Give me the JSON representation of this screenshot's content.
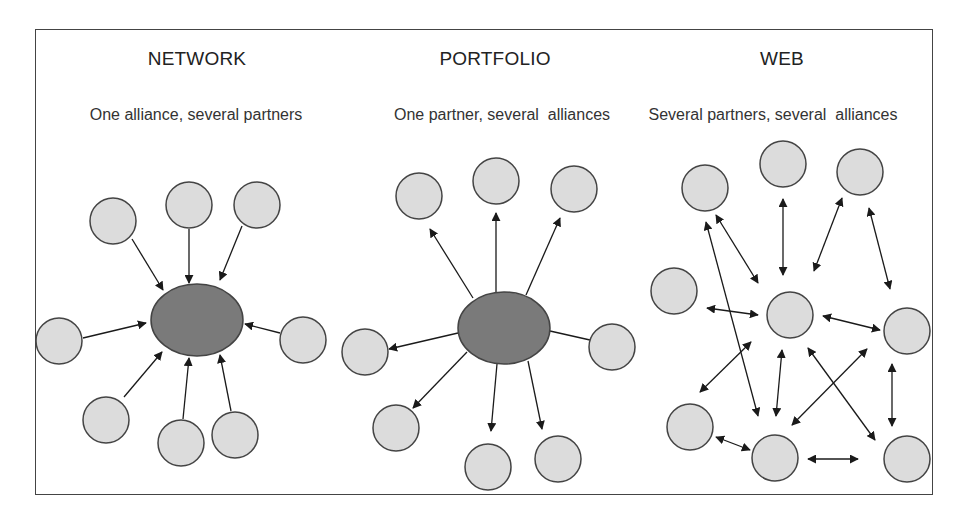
{
  "colors": {
    "partner_fill": "#dcdcdc",
    "hub_fill": "#7a7a7a",
    "stroke": "#444444",
    "arrow": "#1a1a1a"
  },
  "panels": [
    {
      "id": "network",
      "title": "NETWORK",
      "subtitle": "One alliance, several partners",
      "hub": {
        "cx": 197,
        "cy": 320,
        "rx": 46,
        "ry": 36
      },
      "nodes": [
        {
          "cx": 113,
          "cy": 221
        },
        {
          "cx": 189,
          "cy": 205
        },
        {
          "cx": 257,
          "cy": 205
        },
        {
          "cx": 59,
          "cy": 341
        },
        {
          "cx": 303,
          "cy": 340
        },
        {
          "cx": 106,
          "cy": 420
        },
        {
          "cx": 181,
          "cy": 443
        },
        {
          "cx": 235,
          "cy": 435
        }
      ],
      "edges": [
        {
          "x1": 132,
          "y1": 239,
          "x2": 163,
          "y2": 290,
          "head_end": true,
          "head_start": false
        },
        {
          "x1": 189,
          "y1": 229,
          "x2": 189,
          "y2": 283,
          "head_end": true,
          "head_start": false
        },
        {
          "x1": 242,
          "y1": 226,
          "x2": 220,
          "y2": 280,
          "head_end": true,
          "head_start": false
        },
        {
          "x1": 83,
          "y1": 338,
          "x2": 146,
          "y2": 323,
          "head_end": true,
          "head_start": false
        },
        {
          "x1": 280,
          "y1": 333,
          "x2": 245,
          "y2": 324,
          "head_end": true,
          "head_start": false
        },
        {
          "x1": 124,
          "y1": 397,
          "x2": 162,
          "y2": 352,
          "head_end": true,
          "head_start": false
        },
        {
          "x1": 183,
          "y1": 419,
          "x2": 189,
          "y2": 358,
          "head_end": true,
          "head_start": false
        },
        {
          "x1": 231,
          "y1": 411,
          "x2": 220,
          "y2": 355,
          "head_end": true,
          "head_start": false
        }
      ]
    },
    {
      "id": "portfolio",
      "title": "PORTFOLIO",
      "subtitle": "One partner, several  alliances",
      "hub": {
        "cx": 504,
        "cy": 328,
        "rx": 46,
        "ry": 36
      },
      "nodes": [
        {
          "cx": 419,
          "cy": 196
        },
        {
          "cx": 496,
          "cy": 181
        },
        {
          "cx": 574,
          "cy": 189
        },
        {
          "cx": 365,
          "cy": 352
        },
        {
          "cx": 612,
          "cy": 347
        },
        {
          "cx": 396,
          "cy": 428
        },
        {
          "cx": 488,
          "cy": 467
        },
        {
          "cx": 558,
          "cy": 459
        }
      ],
      "edges": [
        {
          "x1": 473,
          "y1": 298,
          "x2": 430,
          "y2": 229,
          "head_end": true,
          "head_start": false
        },
        {
          "x1": 496,
          "y1": 292,
          "x2": 496,
          "y2": 213,
          "head_end": true,
          "head_start": false
        },
        {
          "x1": 526,
          "y1": 295,
          "x2": 560,
          "y2": 218,
          "head_end": true,
          "head_start": false
        },
        {
          "x1": 458,
          "y1": 333,
          "x2": 389,
          "y2": 349,
          "head_end": true,
          "head_start": false
        },
        {
          "x1": 550,
          "y1": 331,
          "x2": 590,
          "y2": 340,
          "head_end": false,
          "head_start": false
        },
        {
          "x1": 467,
          "y1": 352,
          "x2": 413,
          "y2": 408,
          "head_end": true,
          "head_start": false
        },
        {
          "x1": 497,
          "y1": 364,
          "x2": 491,
          "y2": 431,
          "head_end": true,
          "head_start": false
        },
        {
          "x1": 528,
          "y1": 361,
          "x2": 542,
          "y2": 429,
          "head_end": true,
          "head_start": false
        }
      ]
    },
    {
      "id": "web",
      "title": "WEB",
      "subtitle": "Several partners, several  alliances",
      "hub": null,
      "nodes": [
        {
          "cx": 705,
          "cy": 188
        },
        {
          "cx": 783,
          "cy": 164
        },
        {
          "cx": 860,
          "cy": 172
        },
        {
          "cx": 674,
          "cy": 291
        },
        {
          "cx": 790,
          "cy": 315
        },
        {
          "cx": 907,
          "cy": 331
        },
        {
          "cx": 690,
          "cy": 427
        },
        {
          "cx": 775,
          "cy": 458
        },
        {
          "cx": 907,
          "cy": 459
        }
      ],
      "edges": [
        {
          "x1": 716,
          "y1": 215,
          "x2": 758,
          "y2": 283,
          "head_end": true,
          "head_start": true
        },
        {
          "x1": 706,
          "y1": 222,
          "x2": 758,
          "y2": 416,
          "head_end": true,
          "head_start": true
        },
        {
          "x1": 783,
          "y1": 199,
          "x2": 783,
          "y2": 275,
          "head_end": true,
          "head_start": true
        },
        {
          "x1": 842,
          "y1": 198,
          "x2": 814,
          "y2": 271,
          "head_end": true,
          "head_start": true
        },
        {
          "x1": 869,
          "y1": 208,
          "x2": 890,
          "y2": 289,
          "head_end": true,
          "head_start": true
        },
        {
          "x1": 707,
          "y1": 308,
          "x2": 758,
          "y2": 315,
          "head_end": true,
          "head_start": true
        },
        {
          "x1": 823,
          "y1": 316,
          "x2": 880,
          "y2": 330,
          "head_end": true,
          "head_start": true
        },
        {
          "x1": 751,
          "y1": 342,
          "x2": 700,
          "y2": 392,
          "head_end": true,
          "head_start": true
        },
        {
          "x1": 782,
          "y1": 350,
          "x2": 776,
          "y2": 416,
          "head_end": true,
          "head_start": true
        },
        {
          "x1": 808,
          "y1": 348,
          "x2": 875,
          "y2": 440,
          "head_end": true,
          "head_start": true
        },
        {
          "x1": 867,
          "y1": 349,
          "x2": 792,
          "y2": 425,
          "head_end": true,
          "head_start": true
        },
        {
          "x1": 892,
          "y1": 364,
          "x2": 892,
          "y2": 426,
          "head_end": true,
          "head_start": true
        },
        {
          "x1": 716,
          "y1": 437,
          "x2": 750,
          "y2": 450,
          "head_end": true,
          "head_start": true
        },
        {
          "x1": 808,
          "y1": 459,
          "x2": 858,
          "y2": 459,
          "head_end": true,
          "head_start": true
        }
      ]
    }
  ],
  "node_radius": 23
}
